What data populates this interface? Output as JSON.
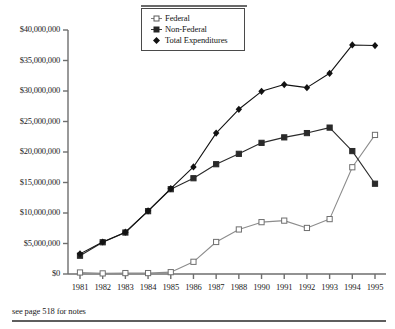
{
  "footnote": {
    "text": "see page 518 for notes"
  },
  "legend": {
    "position": "top-center",
    "entries": [
      {
        "label": "Federal",
        "marker": "open-square",
        "color": "#9a9a9a"
      },
      {
        "label": "Non-Federal",
        "marker": "filled-square",
        "color": "#2b2b2b"
      },
      {
        "label": "Total Expenditures",
        "marker": "filled-diamond",
        "color": "#111111"
      }
    ]
  },
  "chart_data": {
    "type": "line",
    "title": "",
    "subtitle": "",
    "xlabel": "",
    "ylabel": "",
    "grid": false,
    "legend_position": "top-center",
    "categories": [
      "1981",
      "1982",
      "1983",
      "1984",
      "1985",
      "1986",
      "1987",
      "1988",
      "1990",
      "1991",
      "1992",
      "1993",
      "1994",
      "1995"
    ],
    "x_tick_labels": [
      "1981",
      "1982",
      "1983",
      "1984",
      "1985",
      "1986",
      "1987",
      "1988",
      "1990",
      "1991",
      "1992",
      "1993",
      "1994",
      "1995"
    ],
    "y_tick_labels": [
      "$40,000,000",
      "$35,000,000",
      "$30,000,000",
      "$25,000,000",
      "$20,000,000",
      "$15,000,000",
      "$10,000,000",
      "$5,000,000",
      "$0"
    ],
    "y_tick_values": [
      40000000,
      35000000,
      30000000,
      25000000,
      20000000,
      15000000,
      10000000,
      5000000,
      0
    ],
    "ylim": [
      0,
      40000000
    ],
    "series": [
      {
        "name": "Federal",
        "marker": "open-square",
        "color": "#8c8c8c",
        "values": [
          250000,
          100000,
          150000,
          150000,
          300000,
          2000000,
          5250000,
          7300000,
          8500000,
          8750000,
          7550000,
          9000000,
          17500000,
          22800000
        ]
      },
      {
        "name": "Non-Federal",
        "marker": "filled-square",
        "color": "#2a2a2a",
        "values": [
          3000000,
          5200000,
          6800000,
          10300000,
          13900000,
          15700000,
          18000000,
          19700000,
          21500000,
          22400000,
          23100000,
          24000000,
          20150000,
          14800000
        ]
      },
      {
        "name": "Total Expenditures",
        "marker": "filled-diamond",
        "color": "#121212",
        "values": [
          3300000,
          5250000,
          6850000,
          10350000,
          14000000,
          17550000,
          23100000,
          27000000,
          29950000,
          31050000,
          30550000,
          32900000,
          37550000,
          37450000
        ]
      }
    ]
  }
}
